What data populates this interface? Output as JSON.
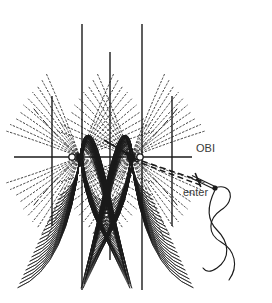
{
  "figure": {
    "title": "",
    "background_color": "#ffffff",
    "ink_color": "#1a1a1a",
    "label_color": "#3a3a3a",
    "width": 272,
    "height": 303,
    "labels": {
      "obi": "OBI",
      "enter": "enter"
    },
    "label_positions": {
      "obi": {
        "x": 196,
        "y": 152
      },
      "enter": {
        "x": 183,
        "y": 196
      }
    },
    "axes": {
      "horizontal": {
        "x1": 14,
        "x2": 192,
        "y": 157
      },
      "verticals": [
        {
          "x": 52,
          "y1": 96,
          "y2": 226
        },
        {
          "x": 82,
          "y1": 24,
          "y2": 290
        },
        {
          "x": 110,
          "y1": 52,
          "y2": 260
        },
        {
          "x": 142,
          "y1": 24,
          "y2": 290
        },
        {
          "x": 172,
          "y1": 96,
          "y2": 226
        }
      ]
    },
    "nodes": [
      {
        "x": 72,
        "y": 157,
        "r": 3.2,
        "kind": "focus-open"
      },
      {
        "x": 80,
        "y": 157,
        "r": 3.2,
        "kind": "focus-filled"
      },
      {
        "x": 131,
        "y": 157,
        "r": 3.4,
        "kind": "focus-filled"
      },
      {
        "x": 140,
        "y": 157,
        "r": 3.2,
        "kind": "focus-open"
      }
    ],
    "fans": {
      "count_per_fan": 22,
      "description": "dense families of curved rays converging at two focal nodes forming four petal lobes",
      "lobe_centers_x": [
        76,
        110,
        136
      ],
      "top_apex_y": 22,
      "bottom_apex_y": 292
    },
    "pointer_arrow": {
      "from": {
        "x": 104,
        "y": 140
      },
      "to": {
        "x": 131,
        "y": 156
      }
    },
    "dashed_rays_to_needle": [
      {
        "x1": 133,
        "y1": 158,
        "x2": 204,
        "y2": 182
      },
      {
        "x1": 133,
        "y1": 160,
        "x2": 203,
        "y2": 186
      }
    ],
    "needle": {
      "tip": {
        "x": 192,
        "y": 177
      },
      "eye": {
        "x": 215,
        "y": 188
      },
      "crossbar_center": {
        "x": 198,
        "y": 180
      },
      "eye_dot_r": 2.6
    },
    "thread": {
      "description": "thread emerging from needle eye, crossing itself in a figure-eight loop and trailing downward",
      "start": {
        "x": 215,
        "y": 188
      }
    },
    "line_styles": {
      "solid": "solid",
      "dashed": "dashed",
      "dotted": "dotted"
    }
  },
  "chart_data": {
    "type": "line",
    "title": "",
    "xlabel": "",
    "ylabel": "",
    "annotations": [
      "OBI",
      "enter"
    ],
    "grid": true,
    "legend_position": "none"
  }
}
